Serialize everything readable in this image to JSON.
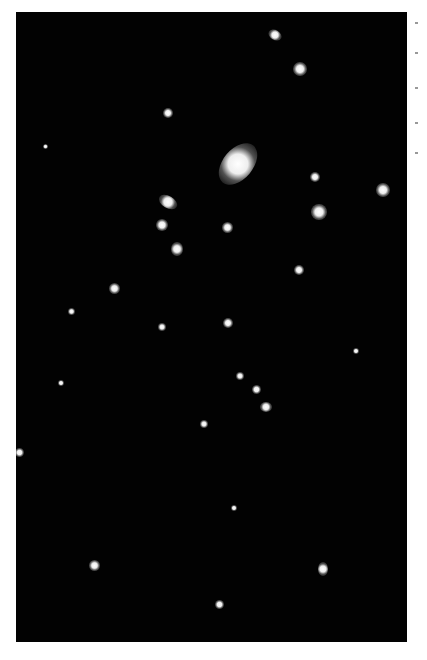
{
  "image": {
    "subject": "deep-field galaxy cluster",
    "background_color": "#020202"
  },
  "sources": [
    {
      "x": 268,
      "y": 30,
      "w": 14,
      "h": 10,
      "rot": 30
    },
    {
      "x": 293,
      "y": 62,
      "w": 14,
      "h": 14,
      "rot": 0
    },
    {
      "x": 163,
      "y": 108,
      "w": 10,
      "h": 10,
      "rot": 0
    },
    {
      "x": 223,
      "y": 140,
      "w": 30,
      "h": 48,
      "rot": 40,
      "main": true
    },
    {
      "x": 310,
      "y": 172,
      "w": 10,
      "h": 10,
      "rot": 0
    },
    {
      "x": 376,
      "y": 183,
      "w": 14,
      "h": 14,
      "rot": 0
    },
    {
      "x": 158,
      "y": 196,
      "w": 20,
      "h": 12,
      "rot": 30
    },
    {
      "x": 156,
      "y": 219,
      "w": 12,
      "h": 12,
      "rot": 0
    },
    {
      "x": 311,
      "y": 204,
      "w": 16,
      "h": 16,
      "rot": 0
    },
    {
      "x": 222,
      "y": 222,
      "w": 11,
      "h": 11,
      "rot": 0
    },
    {
      "x": 171,
      "y": 242,
      "w": 12,
      "h": 14,
      "rot": 0
    },
    {
      "x": 294,
      "y": 265,
      "w": 10,
      "h": 10,
      "rot": 0
    },
    {
      "x": 109,
      "y": 283,
      "w": 11,
      "h": 11,
      "rot": 0
    },
    {
      "x": 68,
      "y": 308,
      "w": 7,
      "h": 7,
      "rot": 0
    },
    {
      "x": 158,
      "y": 323,
      "w": 8,
      "h": 8,
      "rot": 0
    },
    {
      "x": 223,
      "y": 318,
      "w": 10,
      "h": 10,
      "rot": 0
    },
    {
      "x": 353,
      "y": 348,
      "w": 6,
      "h": 6,
      "rot": 0
    },
    {
      "x": 236,
      "y": 372,
      "w": 8,
      "h": 8,
      "rot": 0
    },
    {
      "x": 252,
      "y": 385,
      "w": 9,
      "h": 9,
      "rot": 0
    },
    {
      "x": 260,
      "y": 402,
      "w": 12,
      "h": 10,
      "rot": 0
    },
    {
      "x": 200,
      "y": 420,
      "w": 8,
      "h": 8,
      "rot": 0
    },
    {
      "x": 15,
      "y": 448,
      "w": 9,
      "h": 9,
      "rot": 0
    },
    {
      "x": 231,
      "y": 505,
      "w": 6,
      "h": 6,
      "rot": 0
    },
    {
      "x": 89,
      "y": 560,
      "w": 11,
      "h": 11,
      "rot": 0
    },
    {
      "x": 318,
      "y": 562,
      "w": 10,
      "h": 14,
      "rot": 0
    },
    {
      "x": 215,
      "y": 600,
      "w": 9,
      "h": 9,
      "rot": 0
    },
    {
      "x": 58,
      "y": 380,
      "w": 6,
      "h": 6,
      "rot": 0
    },
    {
      "x": 43,
      "y": 144,
      "w": 5,
      "h": 5,
      "rot": 0
    }
  ]
}
